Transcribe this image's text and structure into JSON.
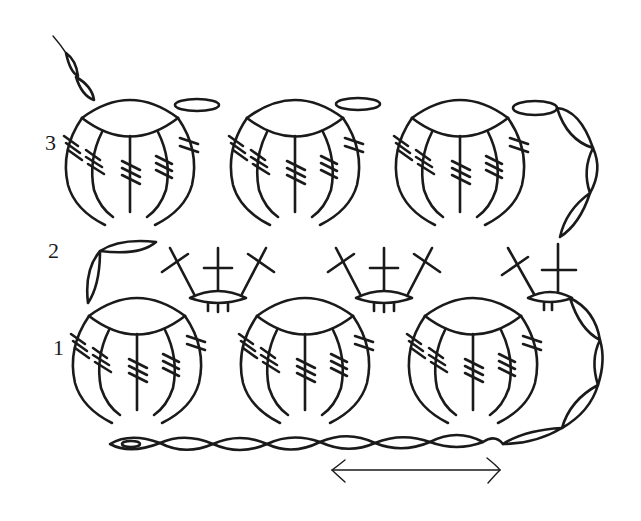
{
  "diagram": {
    "type": "crochet-stitch-chart",
    "row_labels": [
      {
        "label": "3",
        "x": 45,
        "y": 135
      },
      {
        "label": "2",
        "x": 48,
        "y": 243
      },
      {
        "label": "1",
        "x": 53,
        "y": 340
      }
    ],
    "colors": {
      "ink": "#1a1a1a",
      "background": "#ffffff"
    },
    "symbols": {
      "chain": "oval",
      "slip_stitch_start": "oval-with-dot",
      "double_crochet_cluster": "fan of 5 triple-crochet arcs",
      "treble": "cross-stitch",
      "repeat_arrow": "double-headed-arrow"
    },
    "rows": {
      "row1_shells": [
        {
          "cx": 135,
          "cy": 360
        },
        {
          "cx": 305,
          "cy": 360
        },
        {
          "cx": 475,
          "cy": 360
        }
      ],
      "row2_crosses": [
        {
          "cx": 220,
          "cy": 270
        },
        {
          "cx": 385,
          "cy": 270
        },
        {
          "cx": 545,
          "cy": 270
        }
      ],
      "row3_shells": [
        {
          "cx": 130,
          "cy": 160
        },
        {
          "cx": 295,
          "cy": 160
        },
        {
          "cx": 460,
          "cy": 160
        }
      ]
    },
    "repeat": {
      "arrow_from_x": 330,
      "arrow_to_x": 500,
      "y": 470
    }
  }
}
